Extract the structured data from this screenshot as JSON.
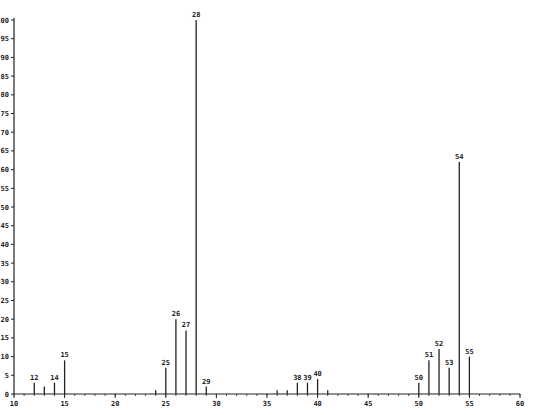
{
  "chart_data": {
    "type": "bar",
    "subtype": "mass-spectrum-stick",
    "title": "",
    "xlabel": "",
    "ylabel": "",
    "xlim": [
      10,
      60
    ],
    "ylim": [
      0,
      100
    ],
    "x_ticks": [
      10,
      15,
      20,
      25,
      30,
      35,
      40,
      45,
      50,
      55,
      60
    ],
    "y_ticks": [
      0,
      5,
      10,
      15,
      20,
      25,
      30,
      35,
      40,
      45,
      50,
      55,
      60,
      65,
      70,
      75,
      80,
      85,
      90,
      95,
      100
    ],
    "grid": false,
    "legend": null,
    "peaks": [
      {
        "mz": 12,
        "intensity": 3,
        "label": "12"
      },
      {
        "mz": 13,
        "intensity": 2,
        "label": ""
      },
      {
        "mz": 14,
        "intensity": 3,
        "label": "14"
      },
      {
        "mz": 15,
        "intensity": 9,
        "label": "15"
      },
      {
        "mz": 24,
        "intensity": 1,
        "label": ""
      },
      {
        "mz": 25,
        "intensity": 7,
        "label": "25"
      },
      {
        "mz": 26,
        "intensity": 20,
        "label": "26"
      },
      {
        "mz": 27,
        "intensity": 17,
        "label": "27"
      },
      {
        "mz": 28,
        "intensity": 100,
        "label": "28"
      },
      {
        "mz": 29,
        "intensity": 2,
        "label": "29"
      },
      {
        "mz": 36,
        "intensity": 1,
        "label": ""
      },
      {
        "mz": 37,
        "intensity": 1,
        "label": ""
      },
      {
        "mz": 38,
        "intensity": 3,
        "label": "38"
      },
      {
        "mz": 39,
        "intensity": 3,
        "label": "39"
      },
      {
        "mz": 40,
        "intensity": 4,
        "label": "40"
      },
      {
        "mz": 41,
        "intensity": 1,
        "label": ""
      },
      {
        "mz": 50,
        "intensity": 3,
        "label": "50"
      },
      {
        "mz": 51,
        "intensity": 9,
        "label": "51"
      },
      {
        "mz": 52,
        "intensity": 12,
        "label": "52"
      },
      {
        "mz": 53,
        "intensity": 7,
        "label": "53"
      },
      {
        "mz": 54,
        "intensity": 62,
        "label": "54"
      },
      {
        "mz": 55,
        "intensity": 10,
        "label": "55"
      }
    ]
  },
  "style": {
    "line_color": "#222222",
    "background": "#ffffff"
  }
}
